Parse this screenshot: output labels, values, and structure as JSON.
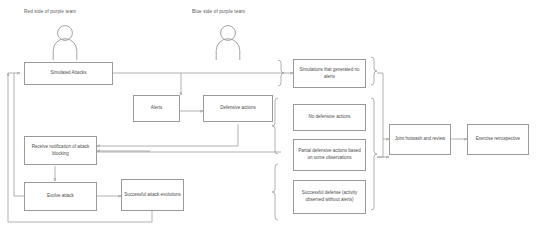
{
  "diagram": {
    "title_labels": {
      "red_side": "Red side of purple team",
      "blue_side": "Blue side of purple team"
    },
    "nodes": {
      "simulated_attacks": "Simulated Attacks",
      "alerts": "Alerts",
      "defensive_actions": "Defensive actions",
      "receive_notification": "Receive notification of attack blocking",
      "evolve_attack": "Evolve attack",
      "successful_attack_evolutions": "Successful attack evolutions",
      "simulations_no_alerts": "Simulations that generated no alerts",
      "no_defensive_actions": "No defensive actions",
      "partial_defensive_actions": "Partial defensive actions based on some observations",
      "successful_defense": "Successful defense (activity observed without alerts)",
      "joint_hotwash": "Joint hotwash and review",
      "exercise_retrospective": "Exercise retrospective"
    },
    "icons": {
      "red_actor": "person-icon",
      "blue_actor": "person-icon"
    },
    "colors": {
      "stroke": "#8f8f8f",
      "box_border": "#9a9a9a",
      "text": "#4a4a4a",
      "background": "#ffffff"
    }
  }
}
